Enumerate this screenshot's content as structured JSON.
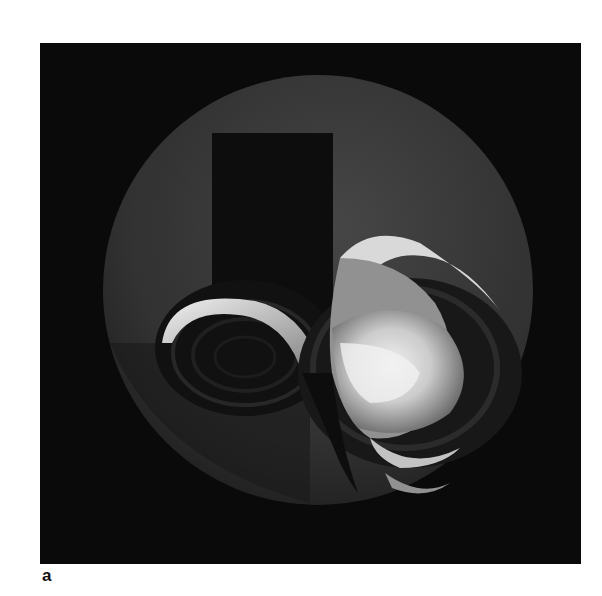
{
  "figure": {
    "panel_label": "a",
    "colors": {
      "background": "#0b0b0b",
      "sphere": "#3a3a3a",
      "highlight": "#f2f2f2",
      "page": "#ffffff"
    }
  }
}
